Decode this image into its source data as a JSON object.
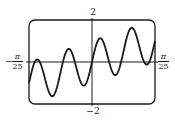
{
  "chart_data": {
    "type": "line",
    "title": "",
    "xlabel": "",
    "ylabel": "",
    "xlim_label": [
      "-π/25",
      "π/25"
    ],
    "xlim": [
      -0.12566,
      0.12566
    ],
    "ylim": [
      -2,
      2
    ],
    "grid": false,
    "legend": null,
    "frame": "rounded-rectangle (graphing calculator window)",
    "axes": {
      "x_axis_at_y": 0,
      "y_axis_at_x": 0
    },
    "tick_labels": {
      "y_top": "2",
      "y_bottom": "−2",
      "x_left": {
        "sign": "−",
        "numerator": "π",
        "denominator": "25"
      },
      "x_right": {
        "numerator": "π",
        "denominator": "25"
      }
    },
    "series": [
      {
        "name": "curve",
        "description": "Oscillating curve with upward linear trend: ~2 full oscillations across window",
        "approx_formula": "y ≈ 8x + sin(100x)",
        "trend_slope": 8,
        "amplitude": 1,
        "angular_frequency": 100,
        "color": "#1a1a1a",
        "samples": 240,
        "key_points": [
          {
            "x": -0.1257,
            "y": -1.0,
            "kind": "start"
          },
          {
            "x": -0.11,
            "y": -0.05,
            "kind": "peak"
          },
          {
            "x": -0.084,
            "y": -1.7,
            "kind": "trough"
          },
          {
            "x": -0.047,
            "y": 0.6,
            "kind": "peak"
          },
          {
            "x": -0.019,
            "y": -1.15,
            "kind": "trough"
          },
          {
            "x": 0.016,
            "y": 1.2,
            "kind": "peak"
          },
          {
            "x": 0.044,
            "y": -0.5,
            "kind": "trough"
          },
          {
            "x": 0.079,
            "y": 1.85,
            "kind": "peak"
          },
          {
            "x": 0.107,
            "y": 0.1,
            "kind": "trough"
          },
          {
            "x": 0.1257,
            "y": 1.2,
            "kind": "end"
          }
        ]
      }
    ]
  },
  "layout": {
    "frame_px": {
      "left": 29,
      "top": 20,
      "right": 155,
      "bottom": 104,
      "radius": 6
    },
    "colors": {
      "ink": "#1a1a1a",
      "background": "#ffffff"
    }
  }
}
